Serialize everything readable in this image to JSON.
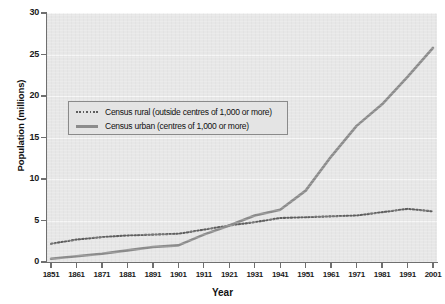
{
  "chart_data": {
    "type": "line",
    "title": "",
    "xlabel": "Year",
    "ylabel": "Population (millions)",
    "xlim": [
      1851,
      2001
    ],
    "ylim": [
      0,
      30
    ],
    "ytick_step": 5,
    "grid": true,
    "legend_position": "upper-left-inside",
    "x": [
      1851,
      1861,
      1871,
      1881,
      1891,
      1901,
      1911,
      1921,
      1931,
      1941,
      1951,
      1961,
      1971,
      1981,
      1991,
      2001
    ],
    "categories": [
      "1851",
      "1861",
      "1871",
      "1881",
      "1891",
      "1901",
      "1911",
      "1921",
      "1931",
      "1941",
      "1951",
      "1961",
      "1971",
      "1981",
      "1991",
      "2001"
    ],
    "ytick_labels": [
      "0",
      "5",
      "10",
      "15",
      "20",
      "25",
      "30"
    ],
    "ytick_values": [
      0,
      5,
      10,
      15,
      20,
      25,
      30
    ],
    "series": [
      {
        "name": "Census rural (outside centres of 1,000 or more)",
        "style": "dotted",
        "color": "#5e5e5e",
        "values": [
          2.2,
          2.7,
          3.0,
          3.2,
          3.3,
          3.4,
          3.9,
          4.4,
          4.8,
          5.3,
          5.4,
          5.5,
          5.6,
          6.0,
          6.4,
          6.1
        ]
      },
      {
        "name": "Census urban (centres of 1,000 or more)",
        "style": "solid",
        "color": "#8c8c8c",
        "values": [
          0.4,
          0.7,
          1.0,
          1.4,
          1.8,
          2.0,
          3.3,
          4.4,
          5.6,
          6.3,
          8.6,
          12.7,
          16.4,
          19.0,
          22.3,
          25.8
        ]
      }
    ]
  },
  "legend": {
    "items": [
      {
        "label": "Census rural (outside centres of 1,000 or more)",
        "style": "dotted"
      },
      {
        "label": "Census urban (centres of 1,000 or more)",
        "style": "solid"
      }
    ]
  },
  "colors": {
    "plot_background": "#e7e7e7",
    "gridline": "#f6f6f6",
    "axis": "#6f6f6f",
    "rural_line": "#5e5e5e",
    "urban_line": "#8c8c8c",
    "legend_background": "#e4e4e4",
    "legend_border": "#8a8a8a",
    "text": "#111111"
  }
}
